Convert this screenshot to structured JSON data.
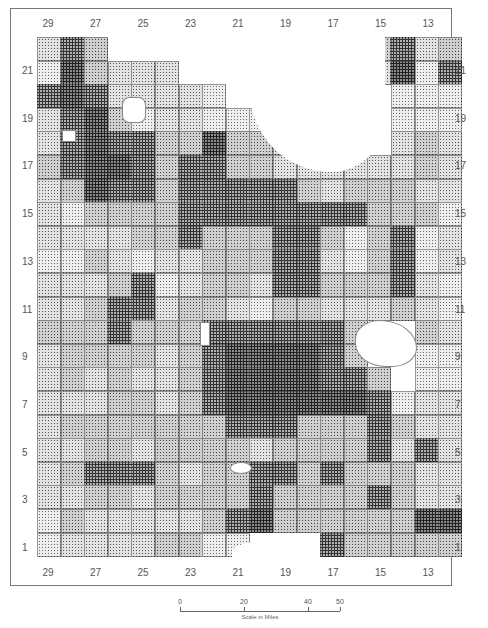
{
  "map": {
    "type": "township choropleth (halftone shading)",
    "column_labels_top": [
      "29",
      "27",
      "25",
      "23",
      "21",
      "19",
      "17",
      "15",
      "13"
    ],
    "column_labels_bottom": [
      "29",
      "27",
      "25",
      "23",
      "21",
      "19",
      "17",
      "15",
      "13"
    ],
    "row_labels_left": [
      "21",
      "19",
      "17",
      "15",
      "13",
      "11",
      "9",
      "7",
      "5",
      "3",
      "1"
    ],
    "row_labels_right": [
      "21",
      "19",
      "17",
      "15",
      "13",
      "11",
      "9",
      "7",
      "5",
      "3",
      "1"
    ],
    "grid_columns": [
      "30",
      "29",
      "28",
      "27",
      "26",
      "25",
      "24",
      "23",
      "22",
      "21",
      "20",
      "19",
      "18",
      "17",
      "16",
      "15",
      "14",
      "13"
    ],
    "grid_rows_top_to_bottom": [
      "22",
      "21",
      "20",
      "19",
      "18",
      "17",
      "16",
      "15",
      "14",
      "13",
      "12",
      "11",
      "10",
      "9",
      "8",
      "7",
      "6",
      "5",
      "4",
      "3",
      "2",
      "1"
    ],
    "shade_levels_note": "0 = outside/none, 1 = lightest ... 5 = darkest",
    "cells": [
      [
        2,
        4,
        3,
        0,
        0,
        0,
        0,
        0,
        0,
        0,
        0,
        0,
        0,
        2,
        3,
        4,
        2,
        3
      ],
      [
        1,
        5,
        3,
        2,
        2,
        2,
        0,
        0,
        0,
        0,
        0,
        0,
        0,
        0,
        2,
        5,
        1,
        4
      ],
      [
        4,
        5,
        4,
        2,
        2,
        2,
        2,
        1,
        0,
        0,
        0,
        0,
        0,
        0,
        0,
        1,
        1,
        1
      ],
      [
        2,
        4,
        5,
        3,
        1,
        2,
        2,
        1,
        1,
        1,
        0,
        0,
        0,
        0,
        0,
        1,
        1,
        1
      ],
      [
        2,
        4,
        5,
        4,
        4,
        3,
        3,
        5,
        3,
        3,
        2,
        2,
        2,
        0,
        0,
        2,
        3,
        2
      ],
      [
        3,
        4,
        5,
        5,
        4,
        3,
        4,
        4,
        3,
        3,
        2,
        2,
        2,
        2,
        2,
        2,
        3,
        2
      ],
      [
        2,
        3,
        5,
        4,
        4,
        3,
        4,
        4,
        4,
        4,
        4,
        3,
        2,
        3,
        3,
        3,
        2,
        2
      ],
      [
        2,
        1,
        3,
        3,
        3,
        3,
        4,
        4,
        4,
        4,
        4,
        4,
        4,
        4,
        3,
        3,
        3,
        1
      ],
      [
        2,
        2,
        2,
        2,
        3,
        3,
        4,
        3,
        3,
        3,
        4,
        4,
        3,
        1,
        3,
        4,
        1,
        2
      ],
      [
        1,
        1,
        3,
        2,
        1,
        2,
        2,
        3,
        3,
        3,
        4,
        4,
        2,
        1,
        3,
        4,
        1,
        2
      ],
      [
        2,
        2,
        2,
        3,
        4,
        1,
        2,
        3,
        3,
        2,
        4,
        4,
        3,
        3,
        3,
        4,
        2,
        1
      ],
      [
        2,
        2,
        3,
        4,
        4,
        2,
        3,
        3,
        2,
        1,
        3,
        3,
        2,
        2,
        2,
        3,
        2,
        1
      ],
      [
        3,
        3,
        3,
        4,
        3,
        3,
        3,
        4,
        4,
        4,
        4,
        4,
        4,
        3,
        0,
        0,
        3,
        2
      ],
      [
        2,
        3,
        3,
        3,
        3,
        2,
        3,
        4,
        5,
        5,
        5,
        5,
        4,
        3,
        0,
        0,
        1,
        1
      ],
      [
        2,
        3,
        2,
        3,
        2,
        2,
        3,
        4,
        5,
        5,
        5,
        5,
        4,
        4,
        3,
        0,
        1,
        1
      ],
      [
        2,
        2,
        2,
        3,
        3,
        2,
        3,
        4,
        5,
        5,
        5,
        5,
        5,
        5,
        4,
        1,
        2,
        2
      ],
      [
        2,
        3,
        3,
        3,
        3,
        3,
        3,
        3,
        4,
        4,
        4,
        3,
        3,
        3,
        4,
        3,
        2,
        2
      ],
      [
        2,
        2,
        3,
        3,
        2,
        3,
        3,
        3,
        3,
        2,
        3,
        3,
        3,
        3,
        4,
        2,
        4,
        2
      ],
      [
        2,
        3,
        4,
        4,
        4,
        3,
        2,
        3,
        3,
        4,
        4,
        3,
        4,
        3,
        3,
        3,
        2,
        2
      ],
      [
        2,
        2,
        3,
        3,
        2,
        3,
        3,
        3,
        3,
        4,
        3,
        3,
        3,
        3,
        4,
        3,
        2,
        2
      ],
      [
        1,
        3,
        2,
        2,
        2,
        2,
        2,
        3,
        4,
        5,
        3,
        3,
        3,
        3,
        3,
        3,
        5,
        5
      ],
      [
        1,
        2,
        2,
        2,
        2,
        3,
        3,
        1,
        1,
        0,
        0,
        0,
        4,
        3,
        3,
        3,
        3,
        3
      ]
    ],
    "scale": {
      "ticks": [
        "0",
        "20",
        "40",
        "50"
      ],
      "caption": "Scale in Miles"
    }
  }
}
